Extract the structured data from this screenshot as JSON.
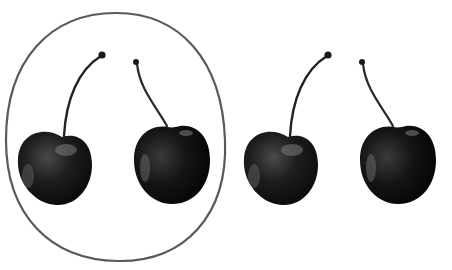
{
  "scene": {
    "description": "Four dark cherries in a row; the first two are enclosed by a hand-drawn oval",
    "background": "#ffffff",
    "cherry_count": 4,
    "grouped_count": 2,
    "ungrouped_count": 2,
    "colors": {
      "oval_stroke": "#555555",
      "cherry_dark": "#111111",
      "cherry_mid": "#2a2a2a",
      "highlight": "#8a8a8a",
      "stem": "#222222"
    }
  },
  "cherries": [
    {
      "id": 1,
      "grouped": true,
      "stem_direction": "right"
    },
    {
      "id": 2,
      "grouped": true,
      "stem_direction": "left"
    },
    {
      "id": 3,
      "grouped": false,
      "stem_direction": "right"
    },
    {
      "id": 4,
      "grouped": false,
      "stem_direction": "left"
    }
  ]
}
